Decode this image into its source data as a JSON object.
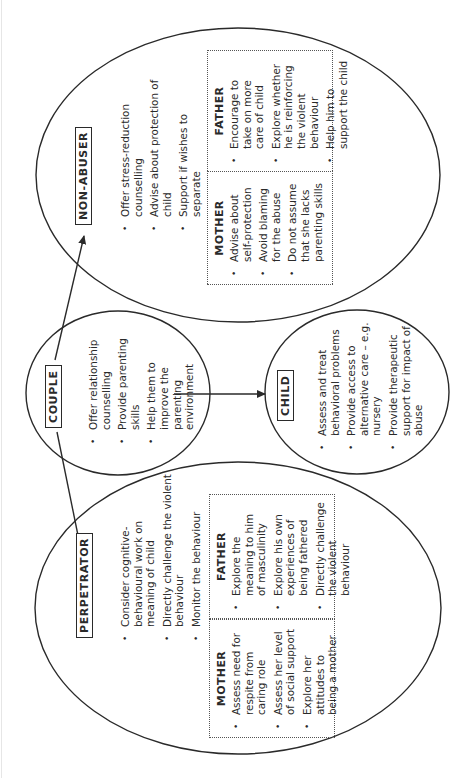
{
  "diagram": {
    "couple": {
      "title": "COUPLE",
      "items": [
        "Offer relationship counselling",
        "Provide parenting skills",
        "Help them to improve the parenting environment"
      ]
    },
    "non_abuser": {
      "title": "NON-ABUSER",
      "items": [
        "Offer stress-reduction counselling",
        "Advise about protection of child",
        "Support if wishes to separate"
      ],
      "mother": {
        "title": "MOTHER",
        "items": [
          "Advise about self-protection",
          "Avoid blaming for the abuse",
          "Do not assume that she lacks parenting skills"
        ]
      },
      "father": {
        "title": "FATHER",
        "items": [
          "Encourage to take on more care of child",
          "Explore whether he is reinforcing the violent behaviour",
          "Help him to support the child"
        ]
      }
    },
    "child": {
      "title": "CHILD",
      "items": [
        "Assess and treat behavioral problems",
        "Provide access to alternative care – e.g. nursery",
        "Provide therapeutic support for impact of abuse"
      ]
    },
    "perpetrator": {
      "title": "PERPETRATOR",
      "items": [
        "Consider cognitive-behavioural work on meaning of child",
        "Directly challenge the violent behaviour",
        "Monitor the behaviour"
      ],
      "mother": {
        "title": "MOTHER",
        "items": [
          "Assess need for respite from caring role",
          "Assess her level of social support",
          "Explore her attitudes to being a mother"
        ]
      },
      "father": {
        "title": "FATHER",
        "items": [
          "Explore the meaning to him of masculinity",
          "Explore his own experiences of being fathered",
          "Directly challenge the violent behaviour"
        ]
      }
    },
    "arrows": [
      {
        "from": "COUPLE",
        "to": "NON-ABUSER"
      },
      {
        "from": "COUPLE",
        "to": "PERPETRATOR"
      },
      {
        "from": "COUPLE",
        "to": "CHILD"
      }
    ],
    "colors": {
      "line": "#2a2a2a",
      "background": "#ffffff"
    }
  }
}
